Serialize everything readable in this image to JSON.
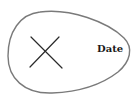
{
  "diagram": {
    "shape": "egg-outline",
    "outline_color": "#7a7a7a",
    "mark": {
      "icon": "x-mark-icon",
      "color": "#2a2a2a"
    },
    "label": "Date",
    "label_color": "#1a1a1a"
  }
}
